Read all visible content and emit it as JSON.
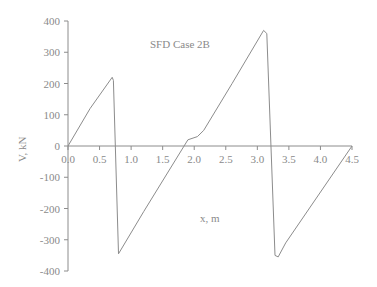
{
  "chart_data": {
    "type": "line",
    "title": "SFD Case 2B",
    "xlabel": "x, m",
    "ylabel": "V, kN",
    "xlim": [
      0,
      4.5
    ],
    "ylim": [
      -400,
      400
    ],
    "x_ticks": [
      "0.0",
      "0.5",
      "1.0",
      "1.5",
      "2.0",
      "2.5",
      "3.0",
      "3.5",
      "4.0",
      "4.5"
    ],
    "y_ticks": [
      "400",
      "300",
      "200",
      "100",
      "0",
      "-100",
      "-200",
      "-300",
      "-400"
    ],
    "grid": false,
    "legend": null,
    "series": [
      {
        "name": "V",
        "x": [
          0.0,
          0.35,
          0.7,
          0.72,
          0.8,
          1.2,
          1.9,
          2.05,
          2.15,
          2.6,
          3.1,
          3.15,
          3.28,
          3.33,
          3.45,
          4.5
        ],
        "y": [
          0,
          120,
          220,
          210,
          -345,
          -210,
          20,
          30,
          50,
          200,
          370,
          360,
          -350,
          -355,
          -310,
          0
        ]
      }
    ],
    "color": "#8c8c8c"
  }
}
